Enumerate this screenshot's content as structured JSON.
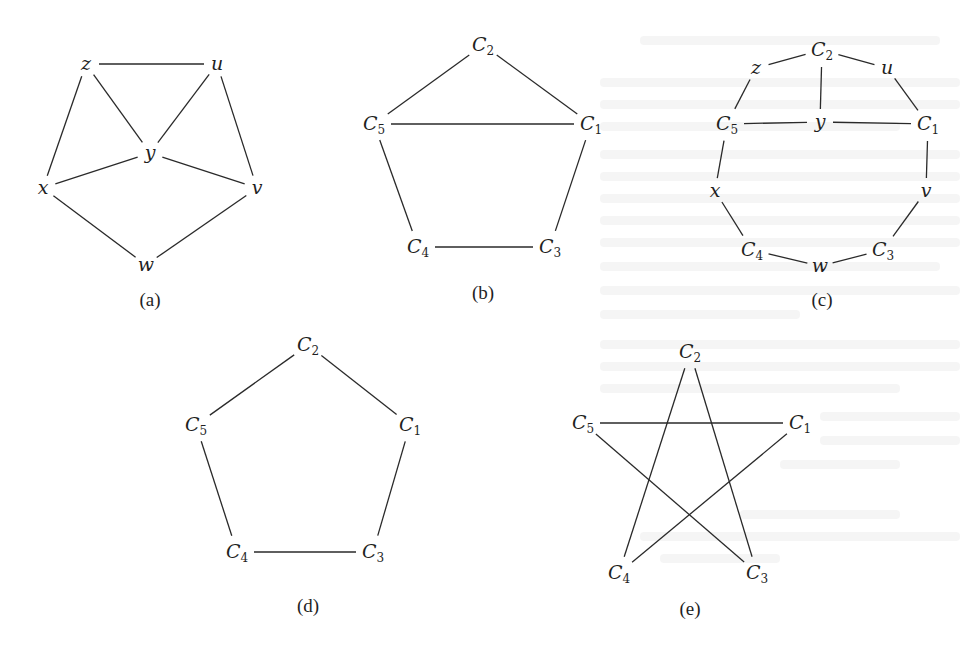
{
  "figure": {
    "panels": [
      {
        "id": "a",
        "caption": "(a)",
        "caption_pos": [
          150,
          306
        ],
        "nodes": [
          {
            "id": "z",
            "label": "z",
            "sub": "",
            "x": 86,
            "y": 64
          },
          {
            "id": "u",
            "label": "u",
            "sub": "",
            "x": 217,
            "y": 64
          },
          {
            "id": "y",
            "label": "y",
            "sub": "",
            "x": 150,
            "y": 153
          },
          {
            "id": "x",
            "label": "x",
            "sub": "",
            "x": 43,
            "y": 188
          },
          {
            "id": "v",
            "label": "v",
            "sub": "",
            "x": 257,
            "y": 188
          },
          {
            "id": "w",
            "label": "w",
            "sub": "",
            "x": 146,
            "y": 265
          }
        ],
        "edges": [
          [
            "z",
            "u"
          ],
          [
            "z",
            "y"
          ],
          [
            "u",
            "y"
          ],
          [
            "z",
            "x"
          ],
          [
            "u",
            "v"
          ],
          [
            "x",
            "y"
          ],
          [
            "y",
            "v"
          ],
          [
            "x",
            "w"
          ],
          [
            "v",
            "w"
          ]
        ]
      },
      {
        "id": "b",
        "caption": "(b)",
        "caption_pos": [
          483,
          299
        ],
        "nodes": [
          {
            "id": "C2",
            "label": "C",
            "sub": "2",
            "x": 483,
            "y": 45
          },
          {
            "id": "C5",
            "label": "C",
            "sub": "5",
            "x": 374,
            "y": 124
          },
          {
            "id": "C1",
            "label": "C",
            "sub": "1",
            "x": 591,
            "y": 124
          },
          {
            "id": "C4",
            "label": "C",
            "sub": "4",
            "x": 418,
            "y": 247
          },
          {
            "id": "C3",
            "label": "C",
            "sub": "3",
            "x": 550,
            "y": 247
          }
        ],
        "edges": [
          [
            "C2",
            "C5"
          ],
          [
            "C2",
            "C1"
          ],
          [
            "C5",
            "C1"
          ],
          [
            "C5",
            "C4"
          ],
          [
            "C1",
            "C3"
          ],
          [
            "C4",
            "C3"
          ]
        ]
      },
      {
        "id": "c",
        "caption": "(c)",
        "caption_pos": [
          822,
          306
        ],
        "nodes": [
          {
            "id": "C2",
            "label": "C",
            "sub": "2",
            "x": 822,
            "y": 50
          },
          {
            "id": "z",
            "label": "z",
            "sub": "",
            "x": 756,
            "y": 68
          },
          {
            "id": "u",
            "label": "u",
            "sub": "",
            "x": 887,
            "y": 68
          },
          {
            "id": "C5",
            "label": "C",
            "sub": "5",
            "x": 727,
            "y": 124
          },
          {
            "id": "y",
            "label": "y",
            "sub": "",
            "x": 820,
            "y": 122
          },
          {
            "id": "C1",
            "label": "C",
            "sub": "1",
            "x": 928,
            "y": 124
          },
          {
            "id": "x",
            "label": "x",
            "sub": "",
            "x": 715,
            "y": 191
          },
          {
            "id": "v",
            "label": "v",
            "sub": "",
            "x": 926,
            "y": 191
          },
          {
            "id": "C4",
            "label": "C",
            "sub": "4",
            "x": 752,
            "y": 250
          },
          {
            "id": "C3",
            "label": "C",
            "sub": "3",
            "x": 883,
            "y": 250
          },
          {
            "id": "w",
            "label": "w",
            "sub": "",
            "x": 820,
            "y": 266
          }
        ],
        "edges": [
          [
            "z",
            "C2"
          ],
          [
            "C2",
            "u"
          ],
          [
            "C2",
            "y"
          ],
          [
            "z",
            "C5"
          ],
          [
            "u",
            "C1"
          ],
          [
            "C5",
            "y"
          ],
          [
            "y",
            "C1"
          ],
          [
            "C5",
            "x"
          ],
          [
            "C1",
            "v"
          ],
          [
            "x",
            "C4"
          ],
          [
            "v",
            "C3"
          ],
          [
            "C4",
            "w"
          ],
          [
            "w",
            "C3"
          ]
        ]
      },
      {
        "id": "d",
        "caption": "(d)",
        "caption_pos": [
          308,
          612
        ],
        "nodes": [
          {
            "id": "C2",
            "label": "C",
            "sub": "2",
            "x": 308,
            "y": 345
          },
          {
            "id": "C5",
            "label": "C",
            "sub": "5",
            "x": 196,
            "y": 425
          },
          {
            "id": "C1",
            "label": "C",
            "sub": "1",
            "x": 410,
            "y": 425
          },
          {
            "id": "C4",
            "label": "C",
            "sub": "4",
            "x": 237,
            "y": 552
          },
          {
            "id": "C3",
            "label": "C",
            "sub": "3",
            "x": 373,
            "y": 552
          }
        ],
        "edges": [
          [
            "C2",
            "C5"
          ],
          [
            "C2",
            "C1"
          ],
          [
            "C5",
            "C4"
          ],
          [
            "C1",
            "C3"
          ],
          [
            "C4",
            "C3"
          ]
        ]
      },
      {
        "id": "e",
        "caption": "(e)",
        "caption_pos": [
          690,
          615
        ],
        "nodes": [
          {
            "id": "C2",
            "label": "C",
            "sub": "2",
            "x": 690,
            "y": 352
          },
          {
            "id": "C5",
            "label": "C",
            "sub": "5",
            "x": 583,
            "y": 423
          },
          {
            "id": "C1",
            "label": "C",
            "sub": "1",
            "x": 800,
            "y": 423
          },
          {
            "id": "C4",
            "label": "C",
            "sub": "4",
            "x": 619,
            "y": 573
          },
          {
            "id": "C3",
            "label": "C",
            "sub": "3",
            "x": 757,
            "y": 573
          }
        ],
        "edges": [
          [
            "C2",
            "C4"
          ],
          [
            "C2",
            "C3"
          ],
          [
            "C5",
            "C1"
          ],
          [
            "C5",
            "C3"
          ],
          [
            "C1",
            "C4"
          ]
        ]
      }
    ]
  }
}
